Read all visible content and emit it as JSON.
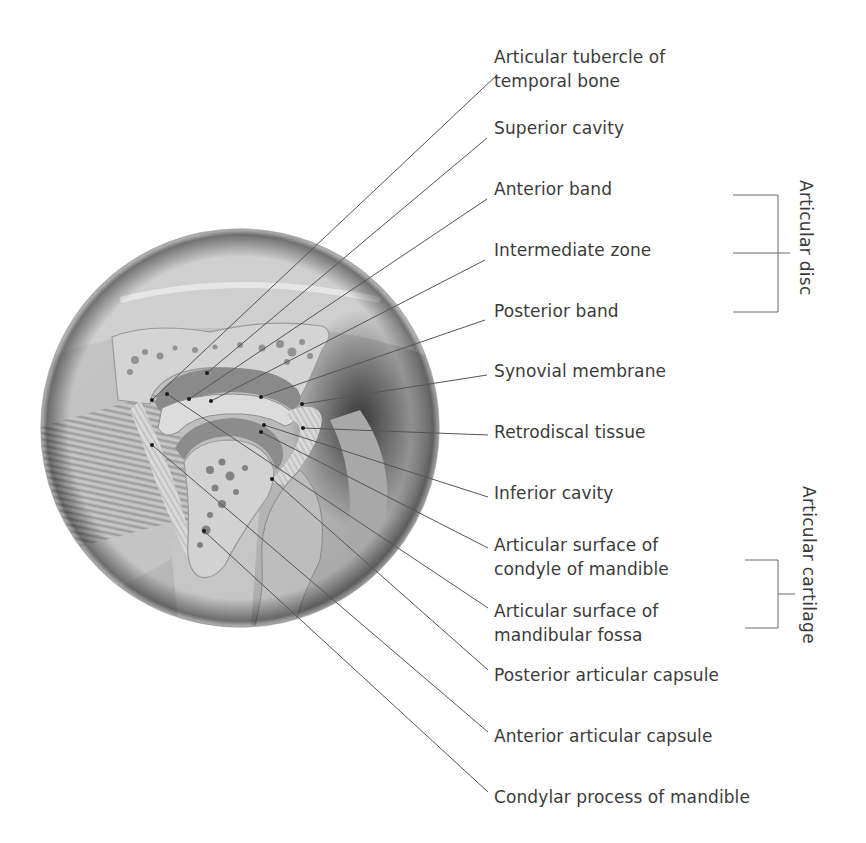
{
  "figure": {
    "colors": {
      "text": "#3b3b3b",
      "leader_line": "#555555",
      "pointer_dot": "#1a1a1a",
      "bracket": "#6a6a6a",
      "background": "#ffffff"
    }
  },
  "labels": [
    {
      "id": "articular-tubercle",
      "lines": [
        "Articular tubercle of",
        "temporal bone"
      ],
      "top": 45,
      "anchor": [
        497,
        75
      ],
      "target": [
        152,
        400
      ]
    },
    {
      "id": "superior-cavity",
      "lines": [
        "Superior cavity"
      ],
      "top": 116,
      "anchor": [
        487,
        138
      ],
      "target": [
        207,
        373
      ]
    },
    {
      "id": "anterior-band",
      "lines": [
        "Anterior band"
      ],
      "top": 177,
      "anchor": [
        487,
        199
      ],
      "target": [
        189,
        399
      ]
    },
    {
      "id": "intermediate-zone",
      "lines": [
        "Intermediate zone"
      ],
      "top": 238,
      "anchor": [
        485,
        260
      ],
      "target": [
        211,
        401
      ]
    },
    {
      "id": "posterior-band",
      "lines": [
        "Posterior band"
      ],
      "top": 299,
      "anchor": [
        485,
        320
      ],
      "target": [
        261,
        397
      ]
    },
    {
      "id": "synovial-membrane",
      "lines": [
        "Synovial membrane"
      ],
      "top": 359,
      "anchor": [
        487,
        375
      ],
      "target": [
        302,
        404
      ]
    },
    {
      "id": "retrodiscal-tissue",
      "lines": [
        "Retrodiscal tissue"
      ],
      "top": 420,
      "anchor": [
        488,
        435
      ],
      "target": [
        303,
        428
      ]
    },
    {
      "id": "inferior-cavity",
      "lines": [
        "Inferior cavity"
      ],
      "top": 481,
      "anchor": [
        488,
        497
      ],
      "target": [
        264,
        425
      ]
    },
    {
      "id": "articular-surface-condyle",
      "lines": [
        "Articular surface of",
        "condyle of mandible"
      ],
      "top": 533,
      "anchor": [
        488,
        548
      ],
      "target": [
        261,
        432
      ]
    },
    {
      "id": "articular-surface-fossa",
      "lines": [
        "Articular surface of",
        "mandibular fossa"
      ],
      "top": 599,
      "anchor": [
        488,
        608
      ],
      "target": [
        167,
        394
      ]
    },
    {
      "id": "posterior-articular-capsule",
      "lines": [
        "Posterior articular capsule"
      ],
      "top": 663,
      "anchor": [
        488,
        670
      ],
      "target": [
        272,
        479
      ]
    },
    {
      "id": "anterior-articular-capsule",
      "lines": [
        "Anterior articular capsule"
      ],
      "top": 724,
      "anchor": [
        488,
        732
      ],
      "target": [
        152,
        445
      ]
    },
    {
      "id": "condylar-process",
      "lines": [
        "Condylar process of mandible"
      ],
      "top": 785,
      "anchor": [
        488,
        792
      ],
      "target": [
        204,
        531
      ]
    }
  ],
  "groups": [
    {
      "id": "articular-disc",
      "label": "Articular disc",
      "members": [
        "Anterior band",
        "Intermediate zone",
        "Posterior band"
      ],
      "bracket": {
        "x1": 733,
        "x2": 778,
        "top": 195,
        "mid": 253,
        "bottom": 312,
        "tick_end": 790
      },
      "text_x": 816,
      "text_y": 180
    },
    {
      "id": "articular-cartilage",
      "label": "Articular cartilage",
      "members": [
        "Articular surface of condyle of mandible",
        "Articular surface of mandibular fossa"
      ],
      "bracket": {
        "x1": 745,
        "x2": 778,
        "top": 560,
        "mid": 594,
        "bottom": 628,
        "tick_end": 795
      },
      "text_x": 819,
      "text_y": 486
    }
  ]
}
